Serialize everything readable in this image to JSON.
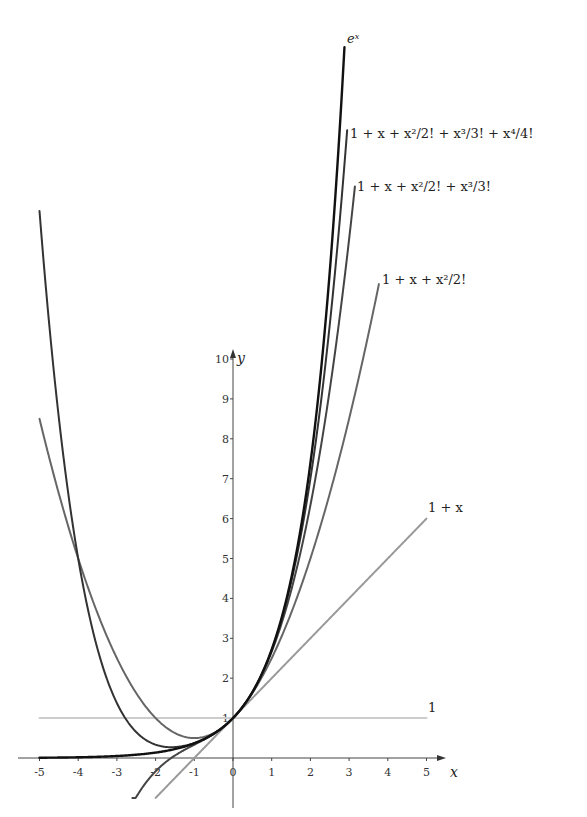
{
  "chart_data": {
    "type": "line",
    "title": "",
    "xlabel": "x",
    "ylabel": "y",
    "xlim": [
      -5,
      5
    ],
    "ylim": [
      -1,
      10
    ],
    "grid": false,
    "x_ticks": [
      "-5",
      "-4",
      "-3",
      "-2",
      "-1",
      "0",
      "1",
      "2",
      "3",
      "4",
      "5"
    ],
    "y_ticks": [
      "1",
      "2",
      "3",
      "4",
      "5",
      "6",
      "7",
      "8",
      "9",
      "10"
    ],
    "series": [
      {
        "name": "e^x",
        "label": "eˣ",
        "degree": -1,
        "x_range": [
          -5,
          2.88
        ],
        "color": "#111111",
        "width": 2.4
      },
      {
        "name": "1 + x + x^2/2! + x^3/3! + x^4/4!",
        "label": "1 + x + x²/2! + x³/3! + x⁴/4!",
        "degree": 4,
        "x_range": [
          -5,
          2.95
        ],
        "color": "#333333",
        "width": 2.0
      },
      {
        "name": "1 + x + x^2/2! + x^3/3!",
        "label": "1 + x + x²/2! + x³/3!",
        "degree": 3,
        "x_range": [
          -2.6,
          3.15
        ],
        "color": "#444444",
        "width": 2.0
      },
      {
        "name": "1 + x + x^2/2!",
        "label": "1 + x + x²/2!",
        "degree": 2,
        "x_range": [
          -5,
          3.77
        ],
        "color": "#666666",
        "width": 2.0
      },
      {
        "name": "1 + x",
        "label": "1 + x",
        "degree": 1,
        "x_range": [
          -2,
          5
        ],
        "color": "#9a9a9a",
        "width": 2.0
      },
      {
        "name": "1",
        "label": "1",
        "degree": 0,
        "x_range": [
          -5,
          5
        ],
        "color": "#cccccc",
        "width": 2.0
      }
    ],
    "legend_position": "inline labels at curve ends"
  }
}
